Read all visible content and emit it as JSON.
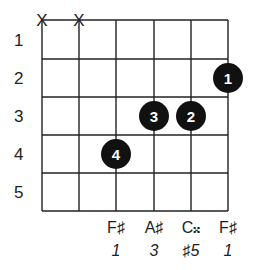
{
  "diagram": {
    "type": "guitar-chord",
    "strings": 6,
    "frets": 5,
    "fret_numbers": [
      "1",
      "2",
      "3",
      "4",
      "5"
    ],
    "muted_strings": [
      1,
      2
    ],
    "muted_symbol": "X",
    "fingers": [
      {
        "string": 6,
        "fret": 2,
        "finger": "1"
      },
      {
        "string": 5,
        "fret": 3,
        "finger": "2"
      },
      {
        "string": 4,
        "fret": 3,
        "finger": "3"
      },
      {
        "string": 3,
        "fret": 4,
        "finger": "4"
      }
    ],
    "notes": [
      {
        "string": 3,
        "note": "F♯",
        "interval": "1"
      },
      {
        "string": 4,
        "note": "A♯",
        "interval": "3"
      },
      {
        "string": 5,
        "note": "C𝄪",
        "interval": "♯5"
      },
      {
        "string": 6,
        "note": "F♯",
        "interval": "1"
      }
    ],
    "colors": {
      "line": "#222222",
      "dot": "#111111",
      "dot_text": "#ffffff"
    }
  }
}
